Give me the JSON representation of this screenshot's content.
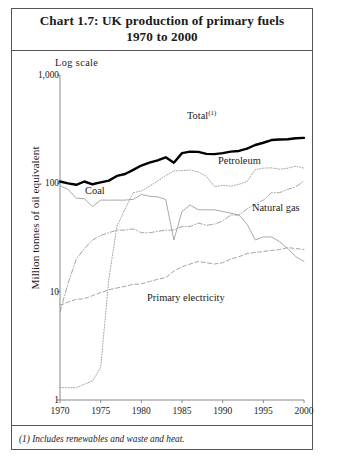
{
  "chart_title": {
    "line1": "Chart 1.7: UK production of primary fuels",
    "line2": "1970 to 2000"
  },
  "footnote": "(1) Includes renewables and waste and heat.",
  "scale_note": "Log scale",
  "labels": {
    "total": "Total",
    "total_footnote_marker": "(1)",
    "petroleum": "Petroleum",
    "coal": "Coal",
    "natural_gas": "Natural gas",
    "primary_electricity": "Primary electricity"
  },
  "chart_data": {
    "type": "line",
    "title": "Chart 1.7: UK production of primary fuels 1970 to 2000",
    "subtitle": "Log scale",
    "xlabel": "",
    "ylabel": "Million tonnes of oil equivalent",
    "yscale": "log",
    "ylim": [
      1,
      1000
    ],
    "ytick_labels": [
      "1,000",
      "100",
      "10",
      "1"
    ],
    "ytick_values": [
      1000,
      100,
      10,
      1
    ],
    "xlim": [
      1970,
      2000
    ],
    "xtick_labels": [
      "1970",
      "1975",
      "1980",
      "1985",
      "1990",
      "1995",
      "2000"
    ],
    "xtick_values": [
      1970,
      1975,
      1980,
      1985,
      1990,
      1995,
      2000
    ],
    "grid": false,
    "legend_position": "inline-annotations",
    "x": [
      1970,
      1971,
      1972,
      1973,
      1974,
      1975,
      1976,
      1977,
      1978,
      1979,
      1980,
      1981,
      1982,
      1983,
      1984,
      1985,
      1986,
      1987,
      1988,
      1989,
      1990,
      1991,
      1992,
      1993,
      1994,
      1995,
      1996,
      1997,
      1998,
      1999,
      2000
    ],
    "series": [
      {
        "name": "Total",
        "style": "thick-solid",
        "color": "#000000",
        "values": [
          104,
          100,
          97,
          104,
          98,
          102,
          106,
          117,
          122,
          133,
          146,
          155,
          163,
          174,
          155,
          190,
          196,
          195,
          187,
          186,
          190,
          196,
          199,
          209,
          226,
          237,
          251,
          254,
          255,
          261,
          263
        ]
      },
      {
        "name": "Petroleum",
        "style": "dotted",
        "color": "#9a9a9a",
        "values": [
          1.3,
          1.3,
          1.3,
          1.4,
          1.5,
          2.0,
          13,
          40,
          58,
          82,
          85,
          94,
          105,
          118,
          130,
          131,
          133,
          127,
          116,
          93,
          96,
          94,
          98,
          104,
          134,
          138,
          139,
          135,
          138,
          144,
          138
        ]
      },
      {
        "name": "Coal",
        "style": "thin-solid",
        "color": "#9a9a9a",
        "values": [
          95,
          88,
          73,
          72,
          61,
          70,
          70,
          70,
          70,
          71,
          79,
          76,
          75,
          71,
          30,
          55,
          63,
          57,
          57,
          57,
          55,
          53,
          51,
          42,
          30,
          32,
          32,
          29,
          25,
          21,
          19
        ]
      },
      {
        "name": "Natural gas",
        "style": "dash-dot",
        "color": "#9a9a9a",
        "values": [
          6.5,
          12,
          20,
          25,
          30,
          33,
          35,
          37,
          37,
          38,
          35,
          35,
          36,
          37,
          37,
          40,
          40,
          43,
          41,
          42,
          45,
          51,
          51,
          58,
          64,
          70,
          82,
          82,
          88,
          93,
          105
        ]
      },
      {
        "name": "Primary electricity",
        "style": "dashed",
        "color": "#9a9a9a",
        "values": [
          7.5,
          8.0,
          8.5,
          8.6,
          9.2,
          9.8,
          10.4,
          10.8,
          11.2,
          11.7,
          11.8,
          12.4,
          13.0,
          13.5,
          15.5,
          17.0,
          18.0,
          19.0,
          18.5,
          18.0,
          18.5,
          20.0,
          21.0,
          22.5,
          23.0,
          23.5,
          24.0,
          24.5,
          25.5,
          25.0,
          24.5
        ]
      }
    ]
  }
}
